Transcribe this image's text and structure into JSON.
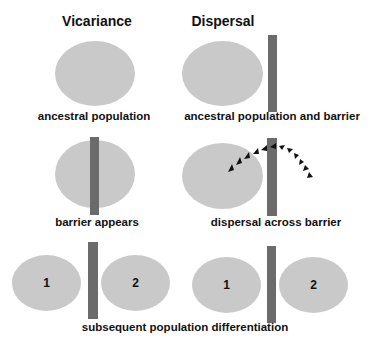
{
  "titles": {
    "left": "Vicariance",
    "right": "Dispersal"
  },
  "labels": {
    "row1_left": "ancestral population",
    "row1_right": "ancestral population and barrier",
    "row2_left": "barrier appears",
    "row2_right": "dispersal across barrier",
    "row3": "subsequent population differentiation"
  },
  "populations": {
    "one": "1",
    "two": "2"
  },
  "colors": {
    "population": "#c9c9c9",
    "barrier": "#6b6b6b",
    "arrow": "#111111"
  }
}
